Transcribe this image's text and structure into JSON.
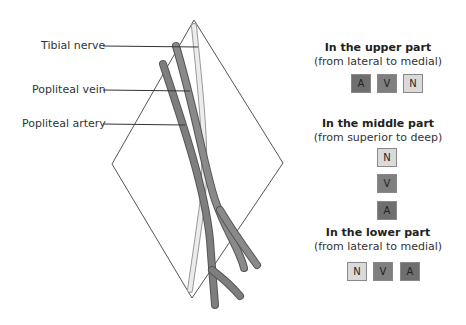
{
  "labels": {
    "tibial_nerve": "Tibial nerve",
    "popliteal_vein": "Popliteal vein",
    "popliteal_artery": "Popliteal artery"
  },
  "legend": {
    "upper": {
      "title": "In the upper part",
      "subtitle": "(from lateral to medial)",
      "boxes": [
        "A",
        "V",
        "N"
      ]
    },
    "middle": {
      "title": "In the middle part",
      "subtitle": "(from superior to deep)",
      "boxes": [
        "N",
        "V",
        "A"
      ]
    },
    "lower": {
      "title": "In the lower part",
      "subtitle": "(from lateral to medial)",
      "boxes": [
        "N",
        "V",
        "A"
      ]
    }
  },
  "colors": {
    "artery": "#6f6f6f",
    "vein": "#7f7f7f",
    "nerve": "#dadada"
  }
}
